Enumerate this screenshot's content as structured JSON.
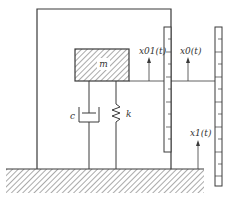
{
  "diagram": {
    "mass": {
      "label": "m"
    },
    "damper": {
      "label": "c"
    },
    "spring": {
      "label": "k"
    },
    "displacements": {
      "x01": "x01(t)",
      "x0": "x0(t)",
      "x1": "x1(t)"
    },
    "colors": {
      "line": "#3a3a3a",
      "hatch": "#555555",
      "background": "#ffffff"
    }
  }
}
